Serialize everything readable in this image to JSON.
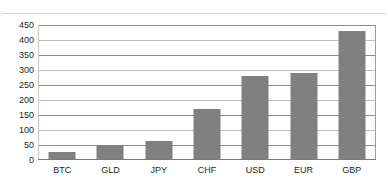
{
  "chart_data": {
    "type": "bar",
    "title": "",
    "subtitle": "",
    "xlabel": "",
    "ylabel": "",
    "categories": [
      "BTC",
      "GLD",
      "JPY",
      "CHF",
      "USD",
      "EUR",
      "GBP"
    ],
    "values": [
      25,
      48,
      60,
      168,
      278,
      288,
      430
    ],
    "series": [
      {
        "name": "",
        "values": [
          25,
          48,
          60,
          168,
          278,
          288,
          430
        ]
      }
    ],
    "ylim": [
      0,
      450
    ],
    "ytick_step": 50,
    "ytick_labels": [
      "450",
      "400",
      "350",
      "300",
      "250",
      "200",
      "150",
      "100",
      "50",
      "0"
    ],
    "ytick_values": [
      450,
      400,
      350,
      300,
      250,
      200,
      150,
      100,
      50,
      0
    ],
    "grid": true,
    "grid_orientation": "horizontal",
    "legend": false,
    "legend_position": "none",
    "annotations": [],
    "colors": {
      "bar_fill": "#808080",
      "gridline": "#8d8d8d",
      "gridline_light": "#bdbdbd",
      "axis": "#7a7a7a",
      "text": "#231f20",
      "background": "#ffffff",
      "top_rule": "#d8d8d8"
    }
  }
}
